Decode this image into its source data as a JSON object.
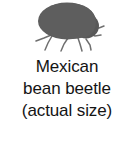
{
  "figure": {
    "background_color": "#ffffff",
    "illustration": {
      "name": "mexican-bean-beetle-silhouette",
      "body_color": "#5e5e5e",
      "leg_color": "#6b6b6b",
      "outline_color": "#4a4a4a"
    },
    "caption": {
      "text_color": "#141414",
      "lines": [
        "Mexican",
        "bean beetle",
        "(actual size)"
      ]
    }
  }
}
